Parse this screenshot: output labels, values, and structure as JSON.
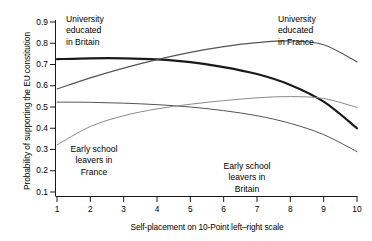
{
  "chart_data": {
    "type": "line",
    "title": "",
    "xlabel": "Self-placement on 10-Point left–right scale",
    "ylabel": "Probability of supporting the EU constitution",
    "xlim": [
      1,
      10
    ],
    "ylim": [
      0.05,
      0.93
    ],
    "xticks": [
      "1",
      "2",
      "3",
      "4",
      "5",
      "6",
      "7",
      "8",
      "9",
      "10"
    ],
    "yticks": [
      "0.1",
      "0.2",
      "0.3",
      "0.4",
      "0.5",
      "0.6",
      "0.7",
      "0.8",
      "0.9"
    ],
    "grid": false,
    "legend_position": "inline-annotations",
    "x": [
      1,
      2,
      3,
      4,
      5,
      6,
      7,
      8,
      9,
      10
    ],
    "series": [
      {
        "name": "University educated in Britain",
        "color": "#1a1a1a",
        "width": 2.2,
        "values": [
          0.725,
          0.729,
          0.729,
          0.724,
          0.711,
          0.688,
          0.655,
          0.604,
          0.525,
          0.4
        ]
      },
      {
        "name": "University educated in France",
        "color": "#555555",
        "width": 1.1,
        "values": [
          0.585,
          0.637,
          0.683,
          0.723,
          0.757,
          0.784,
          0.803,
          0.811,
          0.793,
          0.712
        ]
      },
      {
        "name": "Early school leavers in Britain",
        "color": "#555555",
        "width": 1.0,
        "values": [
          0.523,
          0.522,
          0.518,
          0.511,
          0.5,
          0.483,
          0.459,
          0.423,
          0.37,
          0.29
        ]
      },
      {
        "name": "Early school leavers in France",
        "color": "#8a8a8a",
        "width": 1.0,
        "values": [
          0.322,
          0.408,
          0.459,
          0.491,
          0.513,
          0.53,
          0.543,
          0.549,
          0.54,
          0.498
        ]
      }
    ],
    "annotations": [
      {
        "id": "univ-britain",
        "lines": [
          "University",
          "educated",
          "in Britain"
        ],
        "align": "left",
        "x": 66,
        "y": 14
      },
      {
        "id": "univ-france",
        "lines": [
          "University",
          "educated",
          "in France"
        ],
        "align": "left",
        "x": 278,
        "y": 14
      },
      {
        "id": "esl-france",
        "lines": [
          "Early school",
          "leavers in",
          "France"
        ],
        "align": "center",
        "x": 62,
        "y": 144
      },
      {
        "id": "esl-britain",
        "lines": [
          "Early school",
          "leavers in",
          "Britain"
        ],
        "align": "center",
        "x": 215,
        "y": 161
      }
    ]
  }
}
